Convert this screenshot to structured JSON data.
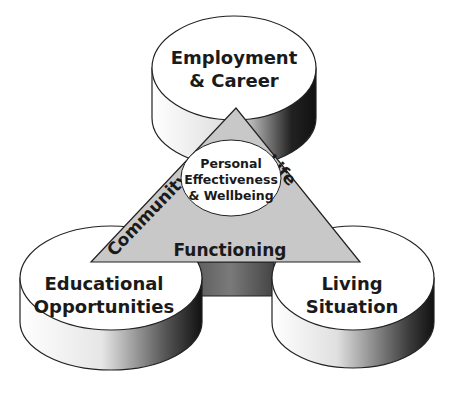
{
  "diagram": {
    "type": "three-cylinders-with-central-triangle",
    "cylinders": [
      {
        "id": "top",
        "lines": [
          "Employment",
          "& Career"
        ]
      },
      {
        "id": "left",
        "lines": [
          "Educational",
          "Opportunities"
        ]
      },
      {
        "id": "right",
        "lines": [
          "Living",
          "Situation"
        ]
      }
    ],
    "triangle": {
      "left_side": "Community",
      "right_side": "Life",
      "bottom": "Functioning",
      "fill": "#c8c8c8"
    },
    "center": {
      "lines": [
        "Personal",
        "Effectiveness",
        "& Wellbeing"
      ]
    },
    "colors": {
      "cylinder_top": "#ffffff",
      "side_dark": "#222222",
      "side_light": "#f0f0f0",
      "stroke": "#222222"
    }
  }
}
